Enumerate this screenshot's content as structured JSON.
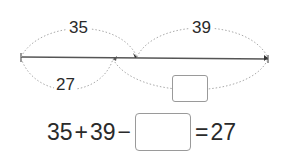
{
  "diagram": {
    "top_labels": [
      "35",
      "39"
    ],
    "bottom_labels": [
      "27"
    ],
    "bottom_box_value": ""
  },
  "equation": {
    "a": "35",
    "plus": "+",
    "b": "39",
    "minus": "−",
    "blank": "",
    "equals": "=",
    "result": "27"
  }
}
